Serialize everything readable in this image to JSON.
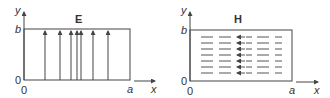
{
  "left_panel": {
    "field_label": "E",
    "y_axis_label": "y",
    "x_axis_label": "x",
    "y_top_label": "b",
    "y_origin_label": "0",
    "x_origin_label": "0",
    "x_end_label": "a",
    "field_direction": "up (+y)",
    "arrow_x_positions": [
      45,
      60,
      71,
      77,
      81,
      93,
      108
    ]
  },
  "right_panel": {
    "field_label": "H",
    "y_axis_label": "y",
    "x_axis_label": "x",
    "y_top_label": "b",
    "y_origin_label": "0",
    "x_origin_label": "0",
    "x_end_label": "a",
    "field_direction": "left (-x)",
    "rows": 7
  },
  "colors": {
    "line": "#444444",
    "text": "#333333"
  }
}
